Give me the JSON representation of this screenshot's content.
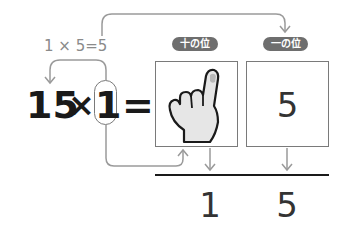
{
  "diagram": {
    "partial_product": "1 × 5=5",
    "labels": {
      "tens_place": "十の位",
      "ones_place": "一の位"
    },
    "equation": {
      "multiplicand": "15",
      "times": "×",
      "multiplier": "1",
      "equals": "="
    },
    "boxes": {
      "tens_content": "hand-pointing-one",
      "ones_content": "5"
    },
    "result": {
      "tens_digit": "1",
      "ones_digit": "5"
    },
    "colors": {
      "line": "#8a8a8a",
      "pill_bg": "#6e6e6e",
      "text_dark": "#1a1a1a",
      "hand_fill": "#e6e6e6"
    }
  }
}
